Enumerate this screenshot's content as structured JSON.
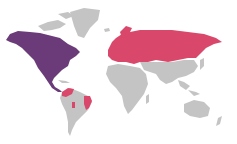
{
  "map": {
    "type": "world-choropleth",
    "colors": {
      "background": "#ffffff",
      "default_land": "#c4c4c4",
      "north_america": "#6b3a78",
      "eurasia_highlight": "#d9476a",
      "south_america_highlight": "#d9476a"
    },
    "regions": [
      {
        "name": "North America (USA/Canada/Mexico/Central America)",
        "color": "#6b3a78"
      },
      {
        "name": "Europe and Russia",
        "color": "#d9476a"
      },
      {
        "name": "Colombia/Venezuela",
        "color": "#d9476a"
      },
      {
        "name": "Eastern Brazil",
        "color": "#d9476a"
      },
      {
        "name": "Peru/Bolivia strip",
        "color": "#d9476a"
      },
      {
        "name": "Greenland",
        "color": "#c4c4c4"
      },
      {
        "name": "Africa",
        "color": "#c4c4c4"
      },
      {
        "name": "Middle East / South Asia / China / SE Asia",
        "color": "#c4c4c4"
      },
      {
        "name": "Australia / Oceania",
        "color": "#c4c4c4"
      },
      {
        "name": "Rest of South America",
        "color": "#c4c4c4"
      }
    ]
  }
}
